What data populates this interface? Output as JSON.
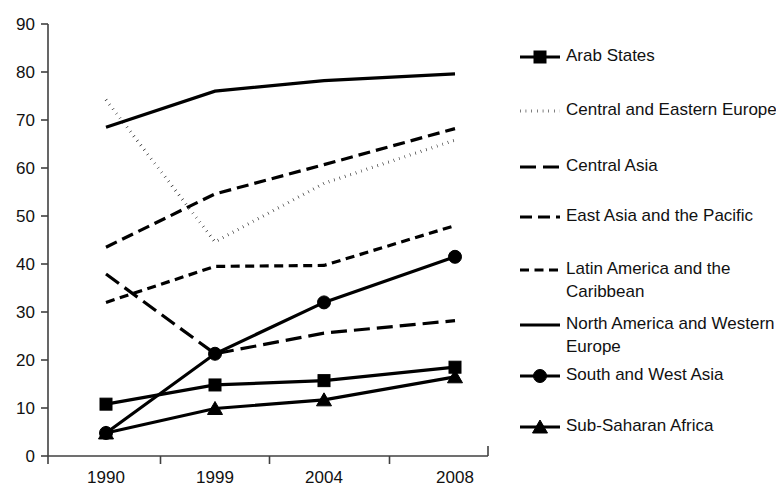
{
  "chart_data": {
    "type": "line",
    "title": "",
    "xlabel": "",
    "ylabel": "",
    "x": [
      "1990",
      "1999",
      "2004",
      "2008"
    ],
    "categories": [
      "1990",
      "1999",
      "2004",
      "2008"
    ],
    "ylim": [
      0,
      90
    ],
    "yticks": [
      0,
      10,
      20,
      30,
      40,
      50,
      60,
      70,
      80,
      90
    ],
    "ytick_labels": [
      "0",
      "10",
      "20",
      "30",
      "40",
      "50",
      "60",
      "70",
      "80",
      "90"
    ],
    "grid": false,
    "legend_position": "right",
    "series": [
      {
        "name": "Arab States",
        "values": [
          10.8,
          14.8,
          15.7,
          18.5
        ],
        "style": "solid",
        "marker": "square"
      },
      {
        "name": "Central and Eastern Europe",
        "values": [
          74.2,
          44.6,
          56.8,
          65.8
        ],
        "style": "dotted",
        "marker": "none"
      },
      {
        "name": "Central Asia",
        "values": [
          37.9,
          21.3,
          25.6,
          28.2
        ],
        "style": "long-dash",
        "marker": "none"
      },
      {
        "name": "East Asia and the Pacific",
        "values": [
          43.5,
          54.6,
          60.7,
          68.2
        ],
        "style": "dashed",
        "marker": "none"
      },
      {
        "name": "Latin America and the Caribbean",
        "values": [
          32.0,
          39.5,
          39.7,
          48.0
        ],
        "style": "short-dash",
        "marker": "none"
      },
      {
        "name": "North America and Western Europe",
        "values": [
          68.5,
          76.0,
          78.2,
          79.6
        ],
        "style": "solid",
        "marker": "none"
      },
      {
        "name": "South and West Asia",
        "values": [
          4.8,
          21.3,
          32.0,
          41.5
        ],
        "style": "solid",
        "marker": "circle"
      },
      {
        "name": "Sub-Saharan Africa",
        "values": [
          4.8,
          9.9,
          11.7,
          16.5
        ],
        "style": "solid",
        "marker": "triangle"
      }
    ],
    "colors": {
      "series": "#000000",
      "axis": "#404040",
      "text": "#111111",
      "background": "#ffffff"
    }
  },
  "legend": {
    "items": [
      {
        "label": "Arab States",
        "style": "solid",
        "marker": "square"
      },
      {
        "label": "Central and Eastern Europe",
        "style": "dotted",
        "marker": "none"
      },
      {
        "label": "Central Asia",
        "style": "long-dash",
        "marker": "none"
      },
      {
        "label": "East Asia and the Pacific",
        "style": "dashed",
        "marker": "none"
      },
      {
        "label": "Latin America and the Caribbean",
        "style": "short-dash",
        "marker": "none"
      },
      {
        "label": "North America and Western Europe",
        "style": "solid",
        "marker": "none"
      },
      {
        "label": "South and West Asia",
        "style": "solid",
        "marker": "circle"
      },
      {
        "label": "Sub-Saharan Africa",
        "style": "solid",
        "marker": "triangle"
      }
    ]
  }
}
